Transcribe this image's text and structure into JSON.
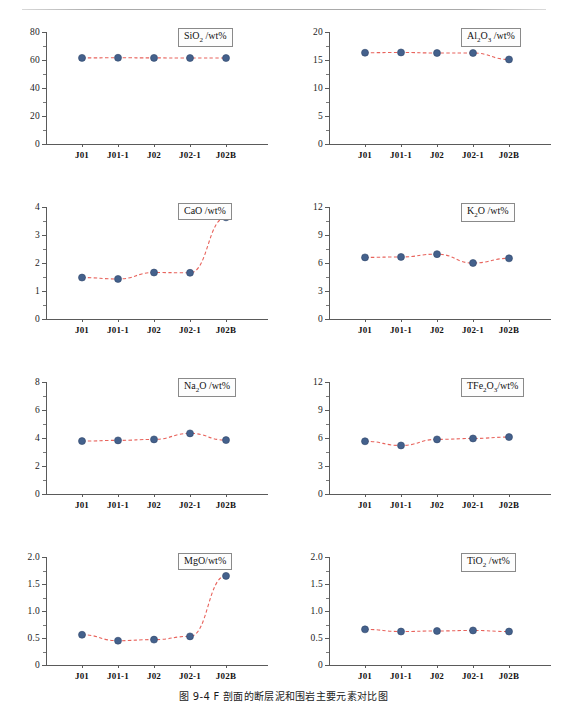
{
  "figure": {
    "caption": "图 9-4  F 剖面的断层泥和围岩主要元素对比图",
    "categories": [
      "J01",
      "J01-1",
      "J02",
      "J02-1",
      "J02B"
    ],
    "marker_color": "#44618c",
    "line_color": "#e8635c",
    "axis_color": "#5a5a5a"
  },
  "chart_data": [
    {
      "type": "line",
      "id": "sio2",
      "title": "SiO2 /wt%",
      "title_html": "SiO<sub>2</sub> /wt%",
      "categories": [
        "J01",
        "J01-1",
        "J02",
        "J02-1",
        "J02B"
      ],
      "values": [
        61.5,
        61.6,
        61.5,
        61.4,
        61.4
      ],
      "ylabel": "",
      "xlabel": "",
      "ylim": [
        0,
        80
      ],
      "yticks": [
        0,
        20,
        40,
        60,
        80
      ],
      "ytick_labels": [
        "0",
        "20",
        "40",
        "60",
        "80"
      ],
      "minor_ticks_per_interval": 1,
      "grid": false,
      "legend_position": "top-right"
    },
    {
      "type": "line",
      "id": "al2o3",
      "title": "Al2O3 /wt%",
      "title_html": "Al<sub>2</sub>O<sub>3</sub> /wt%",
      "categories": [
        "J01",
        "J01-1",
        "J02",
        "J02-1",
        "J02B"
      ],
      "values": [
        16.3,
        16.35,
        16.25,
        16.25,
        15.1
      ],
      "ylabel": "",
      "xlabel": "",
      "ylim": [
        0,
        20
      ],
      "yticks": [
        0,
        5,
        10,
        15,
        20
      ],
      "ytick_labels": [
        "0",
        "5",
        "10",
        "15",
        "20"
      ],
      "minor_ticks_per_interval": 1,
      "grid": false,
      "legend_position": "top-right"
    },
    {
      "type": "line",
      "id": "cao",
      "title": "CaO /wt%",
      "title_html": "CaO /wt%",
      "categories": [
        "J01",
        "J01-1",
        "J02",
        "J02-1",
        "J02B"
      ],
      "values": [
        1.48,
        1.43,
        1.66,
        1.65,
        3.63
      ],
      "ylabel": "",
      "xlabel": "",
      "ylim": [
        0,
        4
      ],
      "yticks": [
        0,
        1,
        2,
        3,
        4
      ],
      "ytick_labels": [
        "0",
        "1",
        "2",
        "3",
        "4"
      ],
      "minor_ticks_per_interval": 1,
      "grid": false,
      "legend_position": "top-right"
    },
    {
      "type": "line",
      "id": "k2o",
      "title": "K2O /wt%",
      "title_html": "K<sub>2</sub>O /wt%",
      "categories": [
        "J01",
        "J01-1",
        "J02",
        "J02-1",
        "J02B"
      ],
      "values": [
        6.6,
        6.65,
        6.95,
        6.0,
        6.5
      ],
      "ylabel": "",
      "xlabel": "",
      "ylim": [
        0,
        12
      ],
      "yticks": [
        0,
        3,
        6,
        9,
        12
      ],
      "ytick_labels": [
        "0",
        "3",
        "6",
        "9",
        "12"
      ],
      "minor_ticks_per_interval": 1,
      "grid": false,
      "legend_position": "top-right"
    },
    {
      "type": "line",
      "id": "na2o",
      "title": "Na2O /wt%",
      "title_html": "Na<sub>2</sub>O /wt%",
      "categories": [
        "J01",
        "J01-1",
        "J02",
        "J02-1",
        "J02B"
      ],
      "values": [
        3.78,
        3.83,
        3.9,
        4.33,
        3.85
      ],
      "ylabel": "",
      "xlabel": "",
      "ylim": [
        0,
        8
      ],
      "yticks": [
        0,
        2,
        4,
        6,
        8
      ],
      "ytick_labels": [
        "0",
        "2",
        "4",
        "6",
        "8"
      ],
      "minor_ticks_per_interval": 1,
      "grid": false,
      "legend_position": "top-right"
    },
    {
      "type": "line",
      "id": "tfe2o3",
      "title": "TFe2O3/wt%",
      "title_html": "TFe<sub>2</sub>O<sub>3</sub>/wt%",
      "categories": [
        "J01",
        "J01-1",
        "J02",
        "J02-1",
        "J02B"
      ],
      "values": [
        5.65,
        5.2,
        5.85,
        5.95,
        6.1
      ],
      "ylabel": "",
      "xlabel": "",
      "ylim": [
        0,
        12
      ],
      "yticks": [
        0,
        3,
        6,
        9,
        12
      ],
      "ytick_labels": [
        "0",
        "3",
        "6",
        "9",
        "12"
      ],
      "minor_ticks_per_interval": 1,
      "grid": false,
      "legend_position": "top-right"
    },
    {
      "type": "line",
      "id": "mgo",
      "title": "MgO/wt%",
      "title_html": "MgO/wt%",
      "categories": [
        "J01",
        "J01-1",
        "J02",
        "J02-1",
        "J02B"
      ],
      "values": [
        0.56,
        0.45,
        0.47,
        0.53,
        1.65
      ],
      "ylabel": "",
      "xlabel": "",
      "ylim": [
        0,
        2.0
      ],
      "yticks": [
        0,
        0.5,
        1.0,
        1.5,
        2.0
      ],
      "ytick_labels": [
        "0",
        "0.5",
        "1.0",
        "1.5",
        "2.0"
      ],
      "minor_ticks_per_interval": 1,
      "grid": false,
      "legend_position": "top-right"
    },
    {
      "type": "line",
      "id": "tio2",
      "title": "TiO2 /wt%",
      "title_html": "TiO<sub>2</sub> /wt%",
      "categories": [
        "J01",
        "J01-1",
        "J02",
        "J02-1",
        "J02B"
      ],
      "values": [
        0.66,
        0.62,
        0.63,
        0.64,
        0.62
      ],
      "ylabel": "",
      "xlabel": "",
      "ylim": [
        0,
        2.0
      ],
      "yticks": [
        0,
        0.5,
        1.0,
        1.5,
        2.0
      ],
      "ytick_labels": [
        "0",
        "0.5",
        "1.0",
        "1.5",
        "2.0"
      ],
      "minor_ticks_per_interval": 1,
      "grid": false,
      "legend_position": "top-right"
    }
  ]
}
